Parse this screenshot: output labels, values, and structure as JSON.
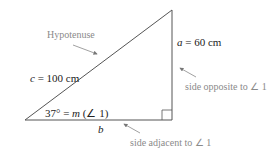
{
  "diagram": {
    "hypotenuse_annotation": "Hypotenuse",
    "hypotenuse_label": {
      "var": "c",
      "rest": " = 100 cm"
    },
    "opposite_label": {
      "var": "a",
      "rest": " = 60 cm"
    },
    "adjacent_label": {
      "var": "b"
    },
    "angle_label": {
      "pre": "37° = ",
      "var": "m",
      "rest": " (∠ 1)"
    },
    "opposite_annotation": "side opposite to ∠ 1",
    "adjacent_annotation": "side adjacent to ∠ 1",
    "colors": {
      "line": "#555555",
      "annotation": "#8a8a8a",
      "arrow": "#777777"
    }
  }
}
